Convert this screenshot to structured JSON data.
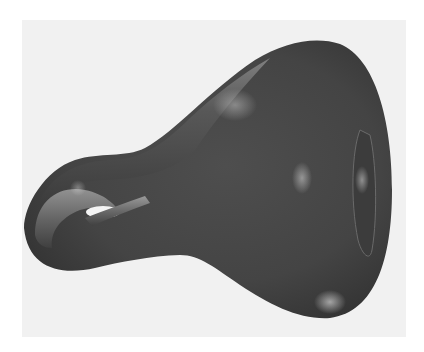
{
  "figure": {
    "colors": {
      "background": "#ffffff",
      "panel": "#f1f1f1",
      "surface_dark": "#3a3a3a",
      "surface_mid": "#5a5a5a",
      "surface_light": "#9a9a9a",
      "highlight": "#e0e0e0"
    }
  }
}
